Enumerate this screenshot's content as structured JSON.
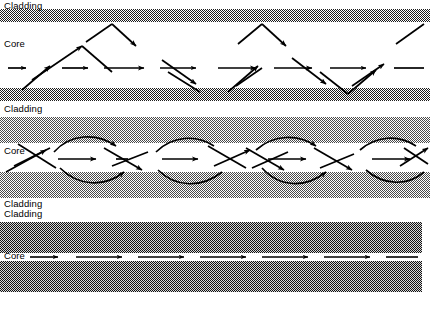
{
  "figure": {
    "width": 430,
    "height": 309,
    "background": "#ffffff",
    "ink_color": "#000000"
  },
  "sections": [
    {
      "id": "multimode-step-index",
      "name": "Multimode step-index fiber",
      "ray_style": "zigzag",
      "labels": {
        "cladding": "Cladding",
        "core": "Core"
      },
      "cladding": {
        "fill": "checker-dither-dark",
        "shade": "#3a3a3a",
        "top_band": {
          "y": 9,
          "height": 13
        },
        "bottom_band": {
          "y": 88,
          "height": 13
        }
      },
      "core": {
        "y": 22,
        "height": 66,
        "fill": "#ffffff"
      },
      "label_positions": {
        "cladding": {
          "x": 4,
          "y": 2
        },
        "core": {
          "x": 4,
          "y": 40
        }
      }
    },
    {
      "id": "graded-index",
      "name": "Graded-index fiber",
      "ray_style": "sinusoidal-curved",
      "labels": {
        "cladding_top": "Cladding",
        "core": "Core",
        "cladding_bottom": "Cladding"
      },
      "cladding": {
        "fill": "checker-dither-gradient",
        "shade": "#6a6a6a",
        "top_band": {
          "y": 117,
          "height": 26,
          "gradient": "dark-to-light"
        },
        "bottom_band": {
          "y": 172,
          "height": 26,
          "gradient": "light-to-dark"
        }
      },
      "core": {
        "y": 143,
        "height": 29,
        "fill": "#ffffff"
      },
      "label_positions": {
        "cladding_top": {
          "x": 4,
          "y": 104
        },
        "core": {
          "x": 4,
          "y": 146
        },
        "cladding_bottom": {
          "x": 4,
          "y": 200
        }
      }
    },
    {
      "id": "single-mode",
      "name": "Single-mode fiber",
      "ray_style": "straight",
      "labels": {
        "cladding": "Cladding",
        "core": "Core"
      },
      "cladding": {
        "fill": "checker-dither-dark",
        "shade": "#2e2e2e",
        "top_band": {
          "y": 222,
          "height": 31
        },
        "bottom_band": {
          "y": 261,
          "height": 31
        }
      },
      "core": {
        "y": 253,
        "height": 8,
        "fill": "#ffffff"
      },
      "label_positions": {
        "cladding": {
          "x": 4,
          "y": 209
        },
        "core": {
          "x": 4,
          "y": 252
        }
      }
    }
  ],
  "rays": {
    "section1_axis_segments": [
      {
        "x1": 8,
        "y1": 68,
        "x2": 30,
        "y2": 68
      },
      {
        "x1": 44,
        "y1": 68,
        "x2": 88,
        "y2": 68
      },
      {
        "x1": 100,
        "y1": 68,
        "x2": 146,
        "y2": 68
      },
      {
        "x1": 160,
        "y1": 68,
        "x2": 204,
        "y2": 68
      },
      {
        "x1": 216,
        "y1": 68,
        "x2": 260,
        "y2": 68
      },
      {
        "x1": 274,
        "y1": 68,
        "x2": 318,
        "y2": 68
      },
      {
        "x1": 330,
        "y1": 68,
        "x2": 372,
        "y2": 68
      },
      {
        "x1": 386,
        "y1": 68,
        "x2": 424,
        "y2": 68
      }
    ],
    "section1_zigzag": "reflecting rays bouncing between top and bottom cladding boundaries",
    "section2_axis_segments": [
      {
        "x1": 8,
        "y1": 159,
        "x2": 44,
        "y2": 159
      },
      {
        "x1": 58,
        "y1": 159,
        "x2": 100,
        "y2": 159
      },
      {
        "x1": 112,
        "y1": 159,
        "x2": 150,
        "y2": 159
      },
      {
        "x1": 162,
        "y1": 159,
        "x2": 204,
        "y2": 159
      },
      {
        "x1": 216,
        "y1": 159,
        "x2": 256,
        "y2": 159
      },
      {
        "x1": 268,
        "y1": 159,
        "x2": 310,
        "y2": 159
      },
      {
        "x1": 322,
        "y1": 159,
        "x2": 362,
        "y2": 159
      },
      {
        "x1": 374,
        "y1": 159,
        "x2": 424,
        "y2": 159
      }
    ],
    "section2_curves": "smoothly curving sinusoidal ray paths bending back toward the axis",
    "section3_segments": [
      {
        "x1": 28,
        "y1": 257,
        "x2": 62,
        "y2": 257
      },
      {
        "x1": 74,
        "y1": 257,
        "x2": 124,
        "y2": 257
      },
      {
        "x1": 136,
        "y1": 257,
        "x2": 186,
        "y2": 257
      },
      {
        "x1": 198,
        "y1": 257,
        "x2": 248,
        "y2": 257
      },
      {
        "x1": 260,
        "y1": 257,
        "x2": 310,
        "y2": 257
      },
      {
        "x1": 322,
        "y1": 257,
        "x2": 372,
        "y2": 257
      },
      {
        "x1": 384,
        "y1": 257,
        "x2": 420,
        "y2": 257
      }
    ]
  }
}
